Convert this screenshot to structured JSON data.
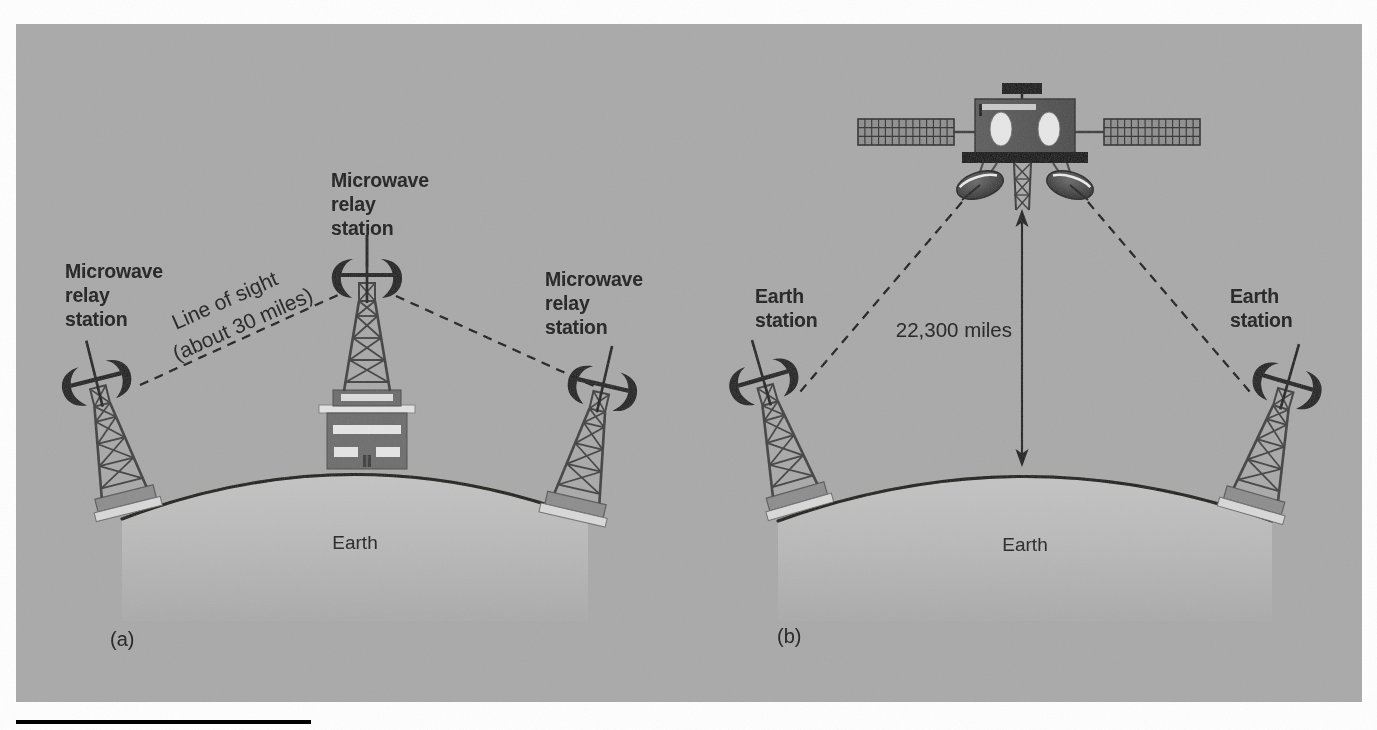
{
  "figure": {
    "background_color": "#ffffff",
    "panel_color": "#a9a9a9",
    "earth_color": "#b9b9b9",
    "ink_color": "#111111",
    "structure_color": "#4a4a4a",
    "rule_color": "#000000"
  },
  "panel_a": {
    "caption": "(a)",
    "earth_label": "Earth",
    "left_station_label": "Microwave\nrelay\nstation",
    "left_station_lines": [
      "Microwave",
      "relay",
      "station"
    ],
    "center_station_lines": [
      "Microwave",
      "relay",
      "station"
    ],
    "right_station_lines": [
      "Microwave",
      "relay",
      "station"
    ],
    "link_label_lines": [
      "Line of sight",
      "(about 30 miles)"
    ],
    "link_label_full": "Line of sight (about 30 miles)"
  },
  "panel_b": {
    "caption": "(b)",
    "earth_label": "Earth",
    "left_station_lines": [
      "Earth",
      "station"
    ],
    "right_station_lines": [
      "Earth",
      "station"
    ],
    "orbit_distance_label": "22,300 miles",
    "satellite_name": "communications-satellite"
  },
  "icons": {
    "horn_antenna": "horn-antenna-icon",
    "lattice_tower": "lattice-tower-icon",
    "relay_building": "relay-building-icon",
    "satellite": "satellite-icon",
    "solar_panel": "solar-panel-icon",
    "dish_antenna": "dish-antenna-icon",
    "distance_arrow": "double-arrow-icon",
    "signal_path": "dashed-signal-path"
  }
}
